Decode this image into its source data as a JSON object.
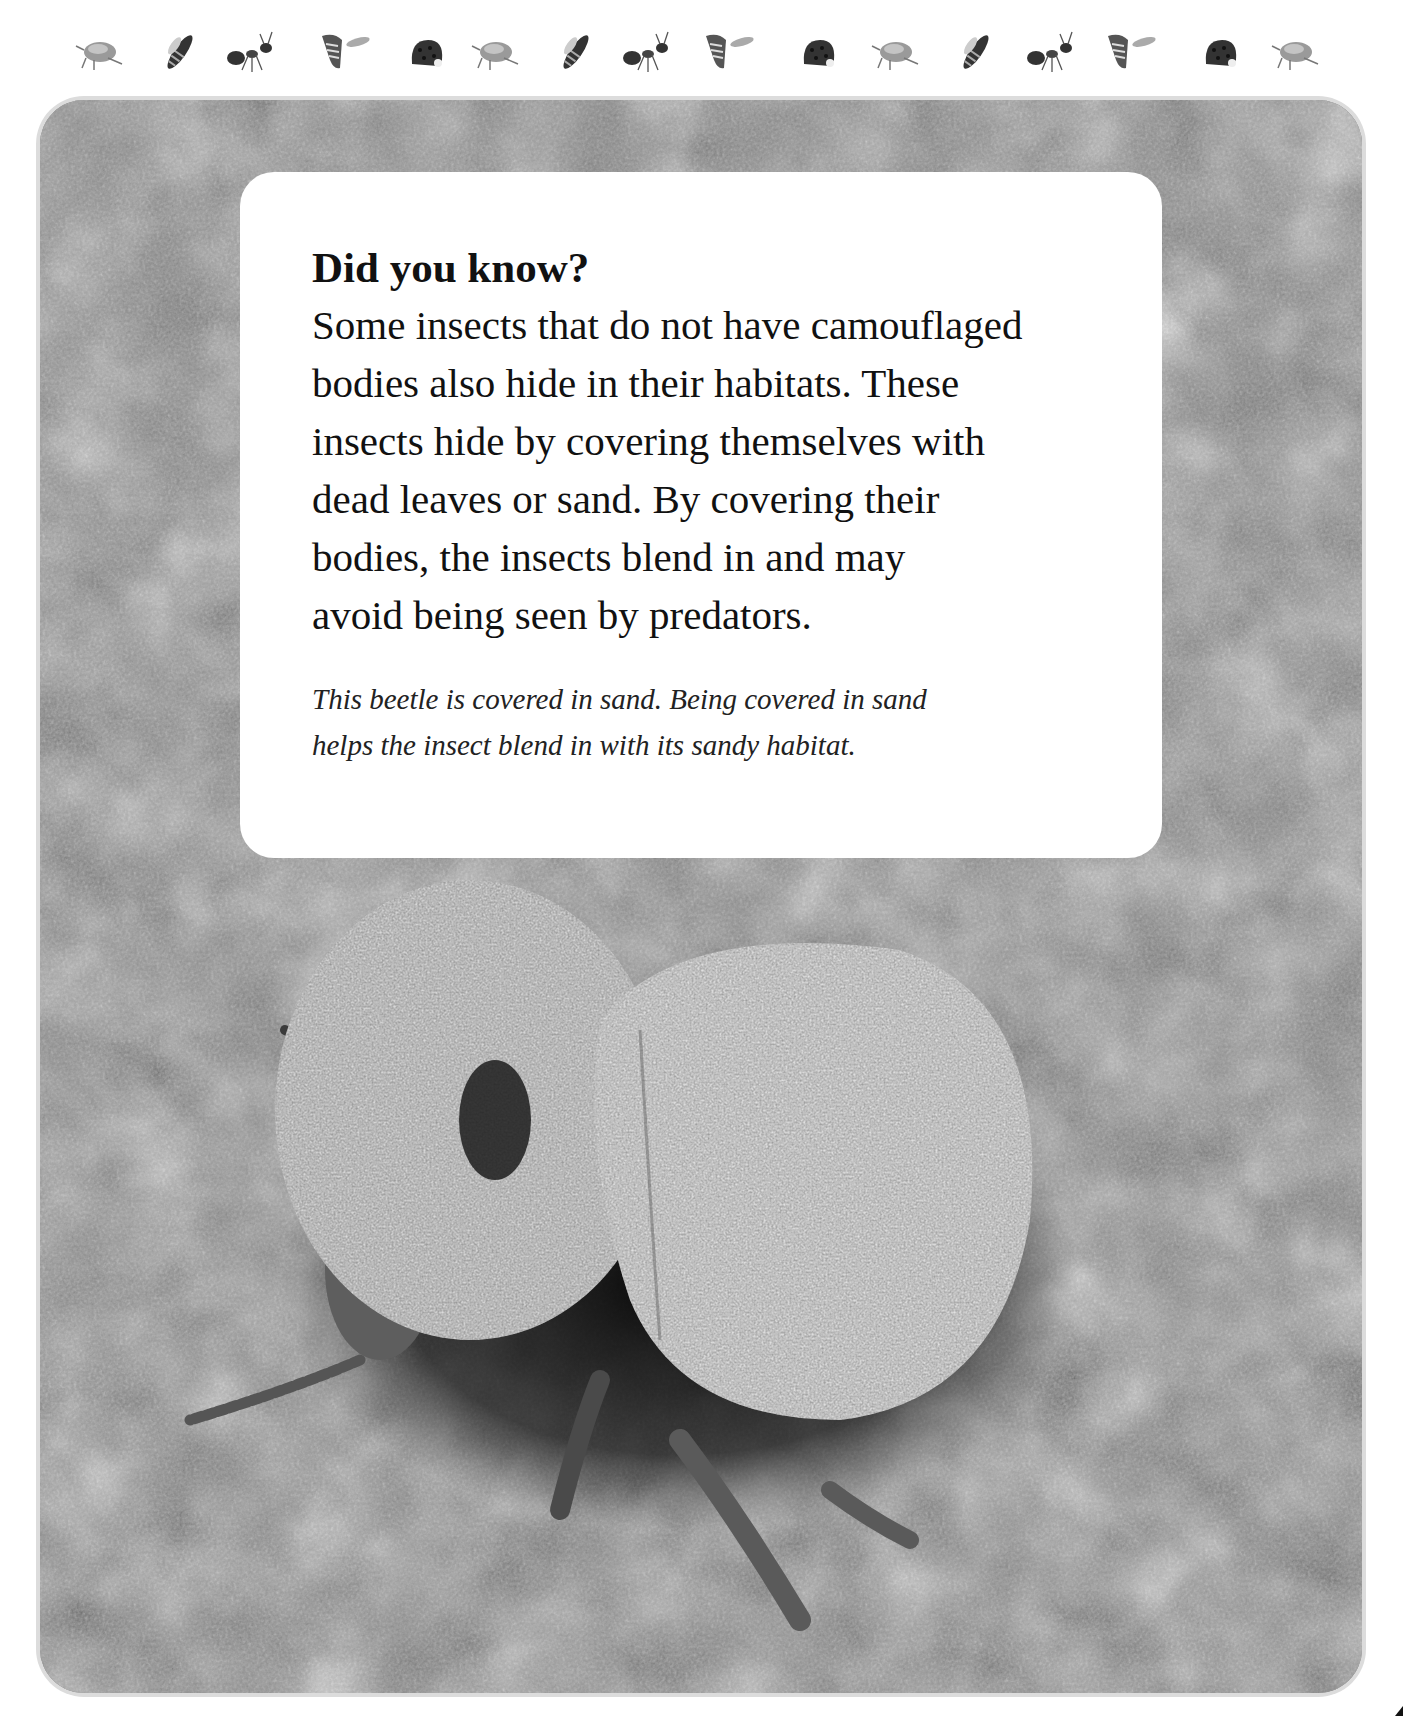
{
  "header": {
    "insect_strip": [
      {
        "icon": "aphid-icon",
        "x": 72
      },
      {
        "icon": "wasp-icon",
        "x": 150
      },
      {
        "icon": "ant-icon",
        "x": 222
      },
      {
        "icon": "fly-icon",
        "x": 312
      },
      {
        "icon": "ladybug-icon",
        "x": 398
      },
      {
        "icon": "aphid-icon",
        "x": 468
      },
      {
        "icon": "wasp-icon",
        "x": 546
      },
      {
        "icon": "ant-icon",
        "x": 618
      },
      {
        "icon": "fly-icon",
        "x": 696
      },
      {
        "icon": "ladybug-icon",
        "x": 790
      },
      {
        "icon": "aphid-icon",
        "x": 868
      },
      {
        "icon": "wasp-icon",
        "x": 946
      },
      {
        "icon": "ant-icon",
        "x": 1022
      },
      {
        "icon": "fly-icon",
        "x": 1098
      },
      {
        "icon": "ladybug-icon",
        "x": 1192
      },
      {
        "icon": "aphid-icon",
        "x": 1268
      }
    ]
  },
  "photo": {
    "subject": "sand-covered beetle on sand",
    "tone": "grayscale"
  },
  "info_box": {
    "title": "Did you know?",
    "body_lines": [
      "Some insects that do not have camouflaged",
      "bodies also hide in their habitats. These",
      "insects hide by covering themselves with",
      "dead leaves or sand. By covering their",
      "bodies, the insects blend in and may",
      "avoid being seen by predators."
    ],
    "caption_lines": [
      "This beetle is covered in sand. Being covered in sand",
      "helps the insect blend in with its sandy habitat."
    ]
  },
  "colors": {
    "page_bg": "#ffffff",
    "photo_mid": "#8a8a8a",
    "text": "#111111"
  }
}
